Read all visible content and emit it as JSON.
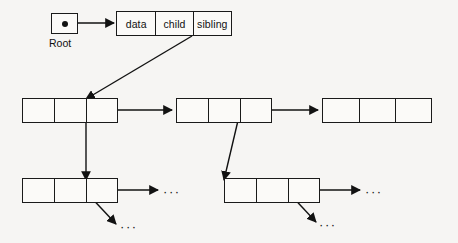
{
  "figure": {
    "background_color": "#f6f5f3",
    "ink_color": "#121212"
  },
  "root": {
    "label": "Root",
    "pointer_icon": "pointer-dot-icon"
  },
  "legend_node": {
    "cells": [
      {
        "label": "data"
      },
      {
        "label": "child"
      },
      {
        "label": "sibling"
      }
    ]
  },
  "row2": {
    "nodes": [
      {
        "data": "",
        "child": "",
        "sibling": ""
      },
      {
        "data": "",
        "child": "",
        "sibling": ""
      },
      {
        "data": "",
        "child": "",
        "sibling": ""
      }
    ]
  },
  "row3": {
    "nodes": [
      {
        "data": "",
        "child": "",
        "sibling": ""
      },
      {
        "data": "",
        "child": "",
        "sibling": ""
      }
    ]
  },
  "ellipses": {
    "row3_node1_sibling": "···",
    "row3_node1_child": "···",
    "row3_node2_sibling": "···",
    "row3_node2_child": "···"
  }
}
